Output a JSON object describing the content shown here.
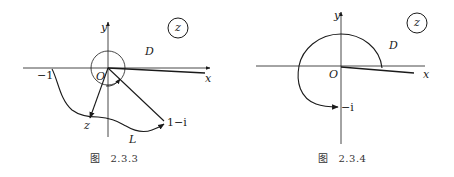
{
  "figures": [
    {
      "id": "fig-2-3-3",
      "caption_prefix": "图",
      "caption_number": "2.3.3",
      "labels": {
        "y_axis": "y",
        "x_axis": "x",
        "plane": "z",
        "domain": "D",
        "origin": "O",
        "minus_one": "−1",
        "point_z": "z",
        "contour": "L",
        "endpoint": "1−i"
      }
    },
    {
      "id": "fig-2-3-4",
      "caption_prefix": "图",
      "caption_number": "2.3.4",
      "labels": {
        "y_axis": "y",
        "x_axis": "x",
        "plane": "z",
        "domain": "D",
        "origin": "O",
        "endpoint": "−i"
      }
    }
  ],
  "colors": {
    "ink": "#1a1a1a",
    "background": "#ffffff"
  }
}
